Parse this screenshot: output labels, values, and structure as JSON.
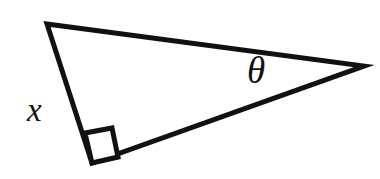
{
  "figure": {
    "kind": "right-triangle-diagram",
    "background_color": "#ffffff",
    "stroke_color": "#111111",
    "stroke_width": 5,
    "canvas": {
      "width": 380,
      "height": 179
    },
    "vertices": {
      "top_left": {
        "name": "A",
        "x": 47,
        "y": 24
      },
      "right": {
        "name": "B",
        "x": 364,
        "y": 66
      },
      "bottom": {
        "name": "C",
        "x": 92,
        "y": 163
      }
    },
    "edges": [
      {
        "name": "hypotenuse-top",
        "from": "top_left",
        "to": "right"
      },
      {
        "name": "side-x",
        "from": "top_left",
        "to": "bottom"
      },
      {
        "name": "side-base",
        "from": "bottom",
        "to": "right"
      }
    ],
    "right_angle_marker": {
      "name": "right-angle-square",
      "at_vertex": "bottom",
      "size": 28,
      "points": "92,163 85,133 112,128 118,157"
    },
    "labels": {
      "side_label": "x",
      "angle_label": "θ",
      "side_label_position": {
        "x": 27,
        "y": 94
      },
      "angle_label_position": {
        "x": 247,
        "y": 52
      }
    }
  }
}
